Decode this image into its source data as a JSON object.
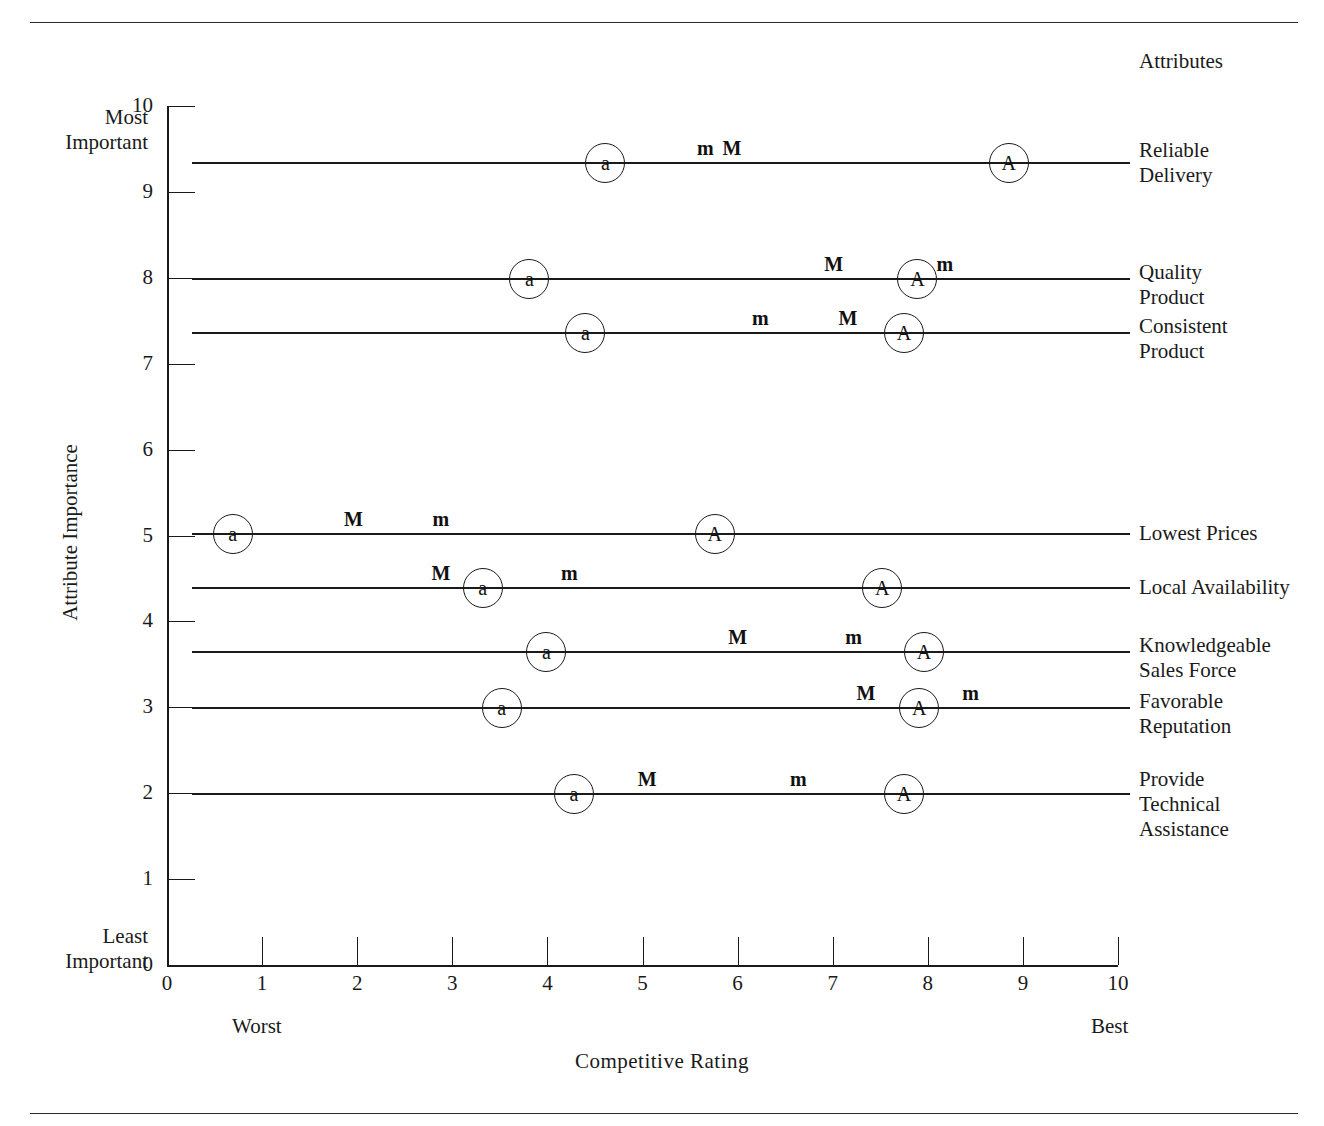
{
  "figure": {
    "attributes_heading": "Attributes",
    "y_axis_title": "Attribute Importance",
    "x_axis_title": "Competitive  Rating",
    "most_important": "Most\nImportant",
    "least_important": "Least\nImportant",
    "worst": "Worst",
    "best": "Best"
  },
  "chart_data": {
    "type": "scatter",
    "title": "",
    "xlabel": "Competitive  Rating",
    "ylabel": "Attribute Importance",
    "xlim": [
      0,
      10
    ],
    "ylim": [
      0,
      10
    ],
    "grid": false,
    "legend": "none",
    "x_ticks": [
      "0",
      "1",
      "2",
      "3",
      "4",
      "5",
      "6",
      "7",
      "8",
      "9",
      "10"
    ],
    "y_ticks": [
      "0",
      "1",
      "2",
      "3",
      "4",
      "5",
      "6",
      "7",
      "8",
      "9",
      "10"
    ],
    "x_end_labels": {
      "low": "Worst",
      "high": "Best"
    },
    "y_end_labels": {
      "low": "Least\nImportant",
      "high": "Most\nImportant"
    },
    "marker_types": {
      "A": "circled-capital-A",
      "a": "circled-lowercase-a",
      "M": "plain-capital-M",
      "m": "plain-lowercase-m"
    },
    "rows": [
      {
        "attribute": "Reliable\nDelivery",
        "importance": 9.35,
        "markers": [
          {
            "label": "a",
            "rating": 4.6,
            "circled": true
          },
          {
            "label": "m",
            "rating": 5.66,
            "circled": false
          },
          {
            "label": "M",
            "rating": 5.94,
            "circled": false
          },
          {
            "label": "A",
            "rating": 8.84,
            "circled": true
          }
        ]
      },
      {
        "attribute": "Quality\nProduct",
        "importance": 8.0,
        "markers": [
          {
            "label": "a",
            "rating": 3.8,
            "circled": true
          },
          {
            "label": "M",
            "rating": 7.01,
            "circled": false
          },
          {
            "label": "A",
            "rating": 7.88,
            "circled": true
          },
          {
            "label": "m",
            "rating": 8.18,
            "circled": false
          }
        ]
      },
      {
        "attribute": "Consistent\nProduct",
        "importance": 7.37,
        "markers": [
          {
            "label": "a",
            "rating": 4.39,
            "circled": true
          },
          {
            "label": "m",
            "rating": 6.24,
            "circled": false
          },
          {
            "label": "M",
            "rating": 7.16,
            "circled": false
          },
          {
            "label": "A",
            "rating": 7.74,
            "circled": true
          }
        ]
      },
      {
        "attribute": "Lowest Prices",
        "importance": 5.03,
        "markers": [
          {
            "label": "a",
            "rating": 0.68,
            "circled": true
          },
          {
            "label": "M",
            "rating": 1.96,
            "circled": false
          },
          {
            "label": "m",
            "rating": 2.88,
            "circled": false
          },
          {
            "label": "A",
            "rating": 5.75,
            "circled": true
          }
        ]
      },
      {
        "attribute": "Local Availability",
        "importance": 4.4,
        "markers": [
          {
            "label": "M",
            "rating": 2.88,
            "circled": false
          },
          {
            "label": "a",
            "rating": 3.31,
            "circled": true
          },
          {
            "label": "m",
            "rating": 4.23,
            "circled": false
          },
          {
            "label": "A",
            "rating": 7.51,
            "circled": true
          }
        ]
      },
      {
        "attribute": "Knowledgeable\nSales Force",
        "importance": 3.66,
        "markers": [
          {
            "label": "a",
            "rating": 3.98,
            "circled": true
          },
          {
            "label": "M",
            "rating": 6.0,
            "circled": false
          },
          {
            "label": "m",
            "rating": 7.22,
            "circled": false
          },
          {
            "label": "A",
            "rating": 7.95,
            "circled": true
          }
        ]
      },
      {
        "attribute": "Favorable\nReputation",
        "importance": 3.0,
        "markers": [
          {
            "label": "a",
            "rating": 3.51,
            "circled": true
          },
          {
            "label": "M",
            "rating": 7.35,
            "circled": false
          },
          {
            "label": "A",
            "rating": 7.9,
            "circled": true
          },
          {
            "label": "m",
            "rating": 8.45,
            "circled": false
          }
        ]
      },
      {
        "attribute": "Provide\nTechnical\nAssistance",
        "importance": 2.0,
        "markers": [
          {
            "label": "a",
            "rating": 4.27,
            "circled": true
          },
          {
            "label": "M",
            "rating": 5.05,
            "circled": false
          },
          {
            "label": "m",
            "rating": 6.64,
            "circled": false
          },
          {
            "label": "A",
            "rating": 7.74,
            "circled": true
          }
        ]
      }
    ],
    "attribute_label_offsets": [
      -24,
      -18,
      -18,
      -12,
      -12,
      -18,
      -18,
      -26
    ]
  }
}
